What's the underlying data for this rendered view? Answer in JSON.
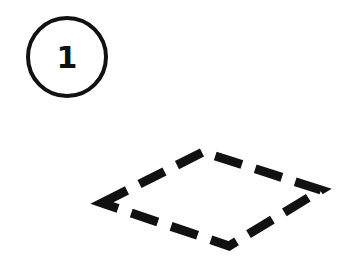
{
  "step": {
    "number": "1"
  },
  "shape": {
    "type": "dashed-rhombus",
    "stroke_color": "#111111",
    "vertices": [
      [
        102,
        203
      ],
      [
        203,
        152
      ],
      [
        321,
        190
      ],
      [
        229,
        246
      ]
    ]
  },
  "colors": {
    "background": "#ffffff",
    "ink": "#111111"
  }
}
